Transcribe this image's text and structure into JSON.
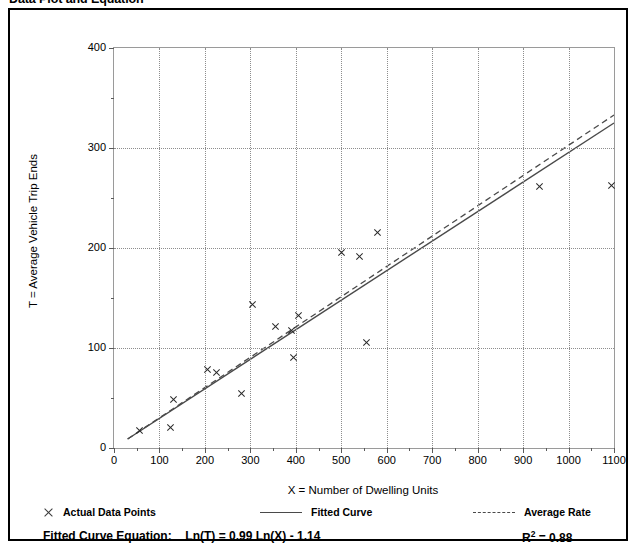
{
  "title": "Data Plot and Equation",
  "chart_data": {
    "type": "scatter",
    "title": "Data Plot and Equation",
    "xlabel": "X = Number of Dwelling Units",
    "ylabel": "T = Average Vehicle Trip Ends",
    "xlim": [
      0,
      1100
    ],
    "ylim": [
      0,
      400
    ],
    "xticks": [
      0,
      100,
      200,
      300,
      400,
      500,
      600,
      700,
      800,
      900,
      1000,
      1100
    ],
    "yticks": [
      0,
      100,
      200,
      300,
      400
    ],
    "grid": true,
    "legend_position": "below-axes",
    "series": [
      {
        "name": "Actual Data Points",
        "type": "scatter",
        "marker": "x",
        "color": "#2a2a2a",
        "points": [
          {
            "x": 55,
            "y": 18
          },
          {
            "x": 125,
            "y": 21
          },
          {
            "x": 130,
            "y": 49
          },
          {
            "x": 205,
            "y": 79
          },
          {
            "x": 225,
            "y": 76
          },
          {
            "x": 280,
            "y": 55
          },
          {
            "x": 305,
            "y": 144
          },
          {
            "x": 355,
            "y": 122
          },
          {
            "x": 390,
            "y": 118
          },
          {
            "x": 395,
            "y": 91
          },
          {
            "x": 405,
            "y": 133
          },
          {
            "x": 500,
            "y": 196
          },
          {
            "x": 540,
            "y": 192
          },
          {
            "x": 555,
            "y": 106
          },
          {
            "x": 580,
            "y": 216
          },
          {
            "x": 935,
            "y": 262
          },
          {
            "x": 1095,
            "y": 263
          }
        ]
      },
      {
        "name": "Fitted Curve",
        "type": "line",
        "style": "solid",
        "color": "#4a4a4a",
        "equation": "Ln(T) = 0.99 Ln(X) - 1.14",
        "endpoints": [
          {
            "x": 30,
            "y": 9
          },
          {
            "x": 1100,
            "y": 325
          }
        ]
      },
      {
        "name": "Average Rate",
        "type": "line",
        "style": "dashed",
        "color": "#4a4a4a",
        "endpoints": [
          {
            "x": 30,
            "y": 9
          },
          {
            "x": 1100,
            "y": 333
          }
        ]
      }
    ],
    "annotations": {
      "equation_label": "Fitted Curve Equation:",
      "equation_text": "Ln(T) = 0.99 Ln(X) - 1.14",
      "r_squared_label": "R",
      "r_squared_sup": "2",
      "r_squared_value": "= 0.88"
    }
  },
  "legend": {
    "items": [
      {
        "label": "Actual Data Points",
        "marker": "x-marker"
      },
      {
        "label": "Fitted Curve",
        "marker": "solid-line"
      },
      {
        "label": "Average Rate",
        "marker": "dashed-line"
      }
    ]
  }
}
